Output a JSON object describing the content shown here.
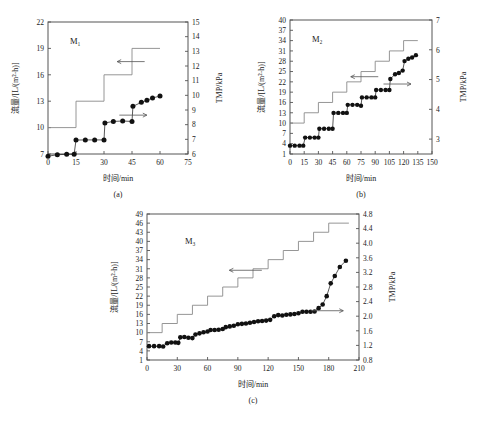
{
  "figure": {
    "axis_labels": {
      "y_left": "流量/[L/(m²·h)]",
      "y_right": "TMP/kPa",
      "x": "时间/min"
    },
    "captions": {
      "a": "(a)",
      "b": "(b)",
      "c": "(c)"
    }
  },
  "chart_data": [
    {
      "type": "line",
      "id": "a",
      "title": "M₁",
      "caption": "(a)",
      "xlabel": "时间/min",
      "ylabel": "流量/[L/(m²·h)]",
      "y2label": "TMP/kPa",
      "xlim": [
        0,
        75
      ],
      "xticks": [
        0,
        15,
        30,
        45,
        60,
        75
      ],
      "ylim": [
        7,
        22
      ],
      "yticks": [
        7,
        10,
        13,
        16,
        19,
        22
      ],
      "y2lim": [
        6,
        15
      ],
      "y2ticks": [
        6,
        7,
        8,
        9,
        10,
        11,
        12,
        13,
        14,
        15
      ],
      "grid": false,
      "legend": "none",
      "series": [
        {
          "name": "流量 (step)",
          "axis": "left",
          "style": "step",
          "points": [
            {
              "x": 0,
              "y": 10
            },
            {
              "x": 15,
              "y": 10
            },
            {
              "x": 15,
              "y": 13
            },
            {
              "x": 30,
              "y": 13
            },
            {
              "x": 30,
              "y": 16
            },
            {
              "x": 45,
              "y": 16
            },
            {
              "x": 45,
              "y": 19
            },
            {
              "x": 60,
              "y": 19
            }
          ]
        },
        {
          "name": "TMP",
          "axis": "right",
          "style": "markers",
          "points": [
            {
              "x": 0,
              "y": 5.85
            },
            {
              "x": 5,
              "y": 5.95
            },
            {
              "x": 10,
              "y": 5.98
            },
            {
              "x": 14,
              "y": 5.99
            },
            {
              "x": 15,
              "y": 6.95
            },
            {
              "x": 20,
              "y": 6.96
            },
            {
              "x": 25,
              "y": 6.96
            },
            {
              "x": 30,
              "y": 6.96
            },
            {
              "x": 30.5,
              "y": 8.12
            },
            {
              "x": 35,
              "y": 8.22
            },
            {
              "x": 40,
              "y": 8.25
            },
            {
              "x": 45,
              "y": 8.22
            },
            {
              "x": 45.5,
              "y": 9.25
            },
            {
              "x": 50,
              "y": 9.52
            },
            {
              "x": 53,
              "y": 9.66
            },
            {
              "x": 56,
              "y": 9.82
            },
            {
              "x": 60,
              "y": 9.95
            }
          ]
        }
      ],
      "annotations": [
        {
          "type": "arrow-left",
          "x": 40,
          "y_left": 17.5,
          "target": "流量"
        },
        {
          "type": "arrow-right",
          "x": 50,
          "y_right": 8.65,
          "target": "TMP"
        }
      ]
    },
    {
      "type": "line",
      "id": "b",
      "title": "M₂",
      "caption": "(b)",
      "xlabel": "时间/min",
      "ylabel": "流量/[L/(m²·h)]",
      "y2label": "TMP/kPa",
      "xlim": [
        0,
        150
      ],
      "xticks": [
        0,
        15,
        30,
        45,
        60,
        75,
        90,
        105,
        120,
        135,
        150
      ],
      "ylim": [
        1,
        40
      ],
      "yticks": [
        1,
        4,
        7,
        10,
        13,
        16,
        19,
        22,
        25,
        28,
        31,
        34,
        37,
        40
      ],
      "y2lim": [
        2.5,
        7
      ],
      "y2ticks": [
        3,
        4,
        5,
        6,
        7
      ],
      "grid": false,
      "legend": "none",
      "series": [
        {
          "name": "流量 (step)",
          "axis": "left",
          "style": "step",
          "points": [
            {
              "x": 0,
              "y": 10
            },
            {
              "x": 15,
              "y": 10
            },
            {
              "x": 15,
              "y": 13
            },
            {
              "x": 30,
              "y": 13
            },
            {
              "x": 30,
              "y": 16
            },
            {
              "x": 45,
              "y": 16
            },
            {
              "x": 45,
              "y": 19
            },
            {
              "x": 60,
              "y": 19
            },
            {
              "x": 60,
              "y": 22
            },
            {
              "x": 75,
              "y": 22
            },
            {
              "x": 75,
              "y": 25
            },
            {
              "x": 90,
              "y": 25
            },
            {
              "x": 90,
              "y": 28
            },
            {
              "x": 105,
              "y": 28
            },
            {
              "x": 105,
              "y": 31
            },
            {
              "x": 120,
              "y": 31
            },
            {
              "x": 120,
              "y": 34
            },
            {
              "x": 135,
              "y": 34
            }
          ]
        },
        {
          "name": "TMP",
          "axis": "right",
          "style": "markers",
          "points": [
            {
              "x": 0,
              "y": 2.78
            },
            {
              "x": 5,
              "y": 2.78
            },
            {
              "x": 10,
              "y": 2.78
            },
            {
              "x": 14,
              "y": 2.78
            },
            {
              "x": 16,
              "y": 3.05
            },
            {
              "x": 21,
              "y": 3.05
            },
            {
              "x": 26,
              "y": 3.05
            },
            {
              "x": 30,
              "y": 3.05
            },
            {
              "x": 31,
              "y": 3.35
            },
            {
              "x": 36,
              "y": 3.35
            },
            {
              "x": 41,
              "y": 3.35
            },
            {
              "x": 45,
              "y": 3.35
            },
            {
              "x": 46,
              "y": 3.88
            },
            {
              "x": 51,
              "y": 3.88
            },
            {
              "x": 56,
              "y": 3.88
            },
            {
              "x": 60,
              "y": 3.88
            },
            {
              "x": 61,
              "y": 4.15
            },
            {
              "x": 66,
              "y": 4.15
            },
            {
              "x": 71,
              "y": 4.15
            },
            {
              "x": 75,
              "y": 4.12
            },
            {
              "x": 76,
              "y": 4.4
            },
            {
              "x": 81,
              "y": 4.4
            },
            {
              "x": 86,
              "y": 4.4
            },
            {
              "x": 90,
              "y": 4.4
            },
            {
              "x": 91,
              "y": 4.65
            },
            {
              "x": 96,
              "y": 4.65
            },
            {
              "x": 101,
              "y": 4.65
            },
            {
              "x": 105,
              "y": 4.65
            },
            {
              "x": 106,
              "y": 5.02
            },
            {
              "x": 111,
              "y": 5.18
            },
            {
              "x": 115,
              "y": 5.22
            },
            {
              "x": 119,
              "y": 5.3
            },
            {
              "x": 121,
              "y": 5.62
            },
            {
              "x": 125,
              "y": 5.7
            },
            {
              "x": 129,
              "y": 5.74
            },
            {
              "x": 133,
              "y": 5.82
            }
          ]
        }
      ],
      "annotations": [
        {
          "type": "arrow-left",
          "x": 70,
          "y_left": 23.5,
          "target": "流量"
        },
        {
          "type": "arrow-right",
          "x": 122,
          "y_right": 4.85,
          "target": "TMP"
        }
      ]
    },
    {
      "type": "line",
      "id": "c",
      "title": "M₃",
      "caption": "(c)",
      "xlabel": "时间/min",
      "ylabel": "流量/[L/(m²·h)]",
      "y2label": "TMP/kPa",
      "xlim": [
        0,
        210
      ],
      "xticks": [
        0,
        30,
        60,
        90,
        120,
        150,
        180,
        210
      ],
      "ylim": [
        1,
        49
      ],
      "yticks": [
        1,
        4,
        7,
        10,
        13,
        16,
        19,
        22,
        25,
        28,
        31,
        34,
        37,
        40,
        43,
        46,
        49
      ],
      "y2lim": [
        0.8,
        4.8
      ],
      "y2ticks": [
        0.8,
        1.2,
        1.6,
        2.0,
        2.4,
        2.8,
        3.2,
        3.6,
        4.0,
        4.4,
        4.8
      ],
      "grid": false,
      "legend": "none",
      "series": [
        {
          "name": "流量 (step)",
          "axis": "left",
          "style": "step",
          "points": [
            {
              "x": 0,
              "y": 10
            },
            {
              "x": 15,
              "y": 10
            },
            {
              "x": 15,
              "y": 13
            },
            {
              "x": 30,
              "y": 13
            },
            {
              "x": 30,
              "y": 16
            },
            {
              "x": 45,
              "y": 16
            },
            {
              "x": 45,
              "y": 19
            },
            {
              "x": 60,
              "y": 19
            },
            {
              "x": 60,
              "y": 22
            },
            {
              "x": 75,
              "y": 22
            },
            {
              "x": 75,
              "y": 25
            },
            {
              "x": 90,
              "y": 25
            },
            {
              "x": 90,
              "y": 28
            },
            {
              "x": 105,
              "y": 28
            },
            {
              "x": 105,
              "y": 31
            },
            {
              "x": 120,
              "y": 31
            },
            {
              "x": 120,
              "y": 34
            },
            {
              "x": 135,
              "y": 34
            },
            {
              "x": 135,
              "y": 37
            },
            {
              "x": 150,
              "y": 37
            },
            {
              "x": 150,
              "y": 40
            },
            {
              "x": 165,
              "y": 40
            },
            {
              "x": 165,
              "y": 43
            },
            {
              "x": 180,
              "y": 43
            },
            {
              "x": 180,
              "y": 46
            },
            {
              "x": 200,
              "y": 46
            }
          ]
        },
        {
          "name": "TMP",
          "axis": "right",
          "style": "markers",
          "points": [
            {
              "x": 2,
              "y": 1.18
            },
            {
              "x": 7,
              "y": 1.18
            },
            {
              "x": 12,
              "y": 1.18
            },
            {
              "x": 16,
              "y": 1.17
            },
            {
              "x": 20,
              "y": 1.26
            },
            {
              "x": 24,
              "y": 1.28
            },
            {
              "x": 28,
              "y": 1.28
            },
            {
              "x": 31,
              "y": 1.27
            },
            {
              "x": 33,
              "y": 1.42
            },
            {
              "x": 37,
              "y": 1.43
            },
            {
              "x": 41,
              "y": 1.41
            },
            {
              "x": 45,
              "y": 1.4
            },
            {
              "x": 48,
              "y": 1.5
            },
            {
              "x": 52,
              "y": 1.53
            },
            {
              "x": 56,
              "y": 1.56
            },
            {
              "x": 60,
              "y": 1.58
            },
            {
              "x": 63,
              "y": 1.62
            },
            {
              "x": 67,
              "y": 1.62
            },
            {
              "x": 71,
              "y": 1.63
            },
            {
              "x": 75,
              "y": 1.65
            },
            {
              "x": 78,
              "y": 1.7
            },
            {
              "x": 82,
              "y": 1.72
            },
            {
              "x": 86,
              "y": 1.74
            },
            {
              "x": 90,
              "y": 1.78
            },
            {
              "x": 94,
              "y": 1.79
            },
            {
              "x": 98,
              "y": 1.8
            },
            {
              "x": 102,
              "y": 1.82
            },
            {
              "x": 106,
              "y": 1.84
            },
            {
              "x": 110,
              "y": 1.86
            },
            {
              "x": 114,
              "y": 1.87
            },
            {
              "x": 118,
              "y": 1.88
            },
            {
              "x": 122,
              "y": 1.9
            },
            {
              "x": 126,
              "y": 2.0
            },
            {
              "x": 130,
              "y": 2.03
            },
            {
              "x": 134,
              "y": 2.02
            },
            {
              "x": 138,
              "y": 2.04
            },
            {
              "x": 142,
              "y": 2.05
            },
            {
              "x": 146,
              "y": 2.06
            },
            {
              "x": 150,
              "y": 2.08
            },
            {
              "x": 154,
              "y": 2.12
            },
            {
              "x": 158,
              "y": 2.12
            },
            {
              "x": 162,
              "y": 2.12
            },
            {
              "x": 166,
              "y": 2.13
            },
            {
              "x": 170,
              "y": 2.22
            },
            {
              "x": 174,
              "y": 2.32
            },
            {
              "x": 178,
              "y": 2.55
            },
            {
              "x": 182,
              "y": 2.9
            },
            {
              "x": 186,
              "y": 3.1
            },
            {
              "x": 191,
              "y": 3.35
            },
            {
              "x": 197,
              "y": 3.52
            }
          ]
        }
      ],
      "annotations": [
        {
          "type": "arrow-left",
          "x": 88,
          "y_left": 30.5,
          "target": "流量"
        },
        {
          "type": "arrow-right",
          "x": 188,
          "y_right": 2.15,
          "target": "TMP"
        }
      ]
    }
  ]
}
